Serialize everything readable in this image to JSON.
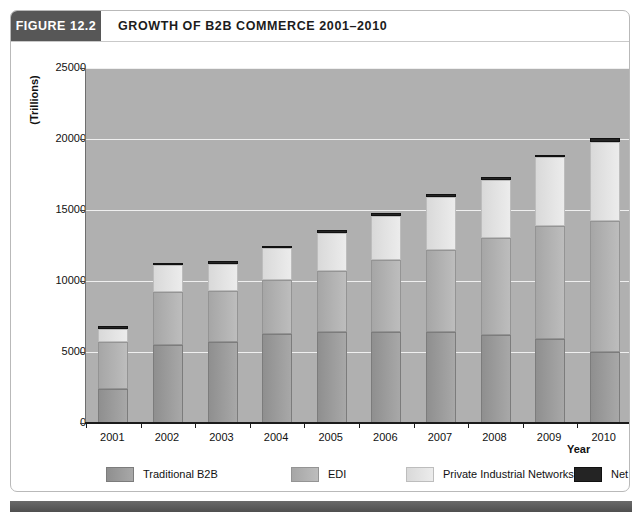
{
  "figure": {
    "tag": "FIGURE 12.2",
    "title": "GROWTH OF B2B COMMERCE 2001–2010"
  },
  "colors": {
    "tag_bg": "#575757",
    "plot_bg": "#b0b0b0",
    "gridline": "#efefef",
    "traditional_b2b": "#9a9a9a",
    "edi": "#b4b4b4",
    "private_industrial_networks": "#e3e3e3",
    "net_markets": "#242424",
    "footer_bar": "#5a5a5a"
  },
  "chart_data": {
    "type": "bar",
    "stacked": true,
    "title": "GROWTH OF B2B COMMERCE 2001–2010",
    "xlabel": "Year",
    "ylabel": "(Trillions)",
    "ylim": [
      0,
      25000
    ],
    "yticks": [
      0,
      5000,
      10000,
      15000,
      20000,
      25000
    ],
    "ytick_labels": [
      "0",
      "5000",
      "10000",
      "15000",
      "20000",
      "25000"
    ],
    "grid": true,
    "grid_axis": "y",
    "legend_position": "bottom",
    "categories": [
      "2001",
      "2002",
      "2003",
      "2004",
      "2005",
      "2006",
      "2007",
      "2008",
      "2009",
      "2010"
    ],
    "series": [
      {
        "name": "Traditional B2B",
        "color": "#9a9a9a",
        "values": [
          2400,
          5500,
          5700,
          6300,
          6400,
          6400,
          6400,
          6200,
          5900,
          5000
        ]
      },
      {
        "name": "EDI",
        "color": "#b4b4b4",
        "values": [
          3300,
          3700,
          3600,
          3800,
          4300,
          5100,
          5800,
          6800,
          8000,
          9200
        ]
      },
      {
        "name": "Private Industrial Networks",
        "color": "#e3e3e3",
        "values": [
          900,
          1900,
          1900,
          2200,
          2700,
          3100,
          3700,
          4100,
          4800,
          5600
        ]
      },
      {
        "name": "Net Markets",
        "color": "#242424",
        "values": [
          200,
          200,
          200,
          200,
          200,
          200,
          200,
          200,
          200,
          300
        ]
      }
    ],
    "totals": [
      6800,
      11300,
      11400,
      12500,
      13600,
      14800,
      16100,
      17300,
      18900,
      20100
    ]
  },
  "legend": {
    "items": [
      {
        "label": "Traditional B2B",
        "swatch": "traditional-b2b-swatch"
      },
      {
        "label": "EDI",
        "swatch": "edi-swatch"
      },
      {
        "label": "Private Industrial Networks",
        "swatch": "private-industrial-networks-swatch"
      },
      {
        "label": "Net Markets",
        "swatch": "net-markets-swatch"
      }
    ]
  }
}
